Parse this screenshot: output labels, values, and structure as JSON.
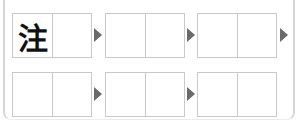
{
  "puzzle": {
    "rows": [
      {
        "boxes": [
          {
            "cells": [
              "注",
              ""
            ]
          },
          {
            "cells": [
              "",
              ""
            ]
          },
          {
            "cells": [
              "",
              ""
            ]
          }
        ],
        "arrows_after": [
          0,
          1,
          2
        ]
      },
      {
        "boxes": [
          {
            "cells": [
              "",
              ""
            ]
          },
          {
            "cells": [
              "",
              ""
            ]
          },
          {
            "cells": [
              "",
              ""
            ]
          }
        ],
        "arrows_after": [
          0,
          1
        ]
      }
    ],
    "colors": {
      "box_border": "#c9c9c9",
      "arrow": "#6a6a6a",
      "text": "#111111",
      "frame": "#d6d6d6"
    },
    "icons": {
      "arrow": "triangle-right-icon"
    }
  }
}
